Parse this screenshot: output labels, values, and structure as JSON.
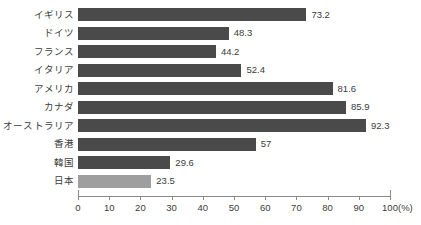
{
  "chart_data": {
    "type": "bar",
    "orientation": "horizontal",
    "title": "",
    "subtitle": "",
    "xlabel": "(%)",
    "ylabel": "",
    "xlim": [
      0,
      100
    ],
    "grid": false,
    "legend": false,
    "legend_position": "none",
    "categories": [
      "イギリス",
      "ドイツ",
      "フランス",
      "イタリア",
      "アメリカ",
      "カナダ",
      "オーストラリア",
      "香港",
      "韓国",
      "日本"
    ],
    "values": [
      73.2,
      48.3,
      44.2,
      52.4,
      81.6,
      85.9,
      92.3,
      57,
      29.6,
      23.5
    ],
    "value_labels": [
      "73.2",
      "48.3",
      "44.2",
      "52.4",
      "81.6",
      "85.9",
      "92.3",
      "57",
      "29.6",
      "23.5"
    ],
    "bar_colors": [
      "#4a4a4a",
      "#4a4a4a",
      "#4a4a4a",
      "#4a4a4a",
      "#4a4a4a",
      "#4a4a4a",
      "#4a4a4a",
      "#4a4a4a",
      "#4a4a4a",
      "#9e9e9e"
    ],
    "highlight_index": 9,
    "xticks": [
      0,
      10,
      20,
      30,
      40,
      50,
      60,
      70,
      80,
      90,
      100
    ],
    "xtick_labels": [
      "0",
      "10",
      "20",
      "30",
      "40",
      "50",
      "60",
      "70",
      "80",
      "90",
      "100"
    ],
    "unit": "(%)"
  },
  "colors": {
    "bar_default": "#4a4a4a",
    "bar_highlight": "#9e9e9e",
    "axis": "#8a8a8a",
    "text": "#3c3c3c",
    "background": "#ffffff"
  }
}
